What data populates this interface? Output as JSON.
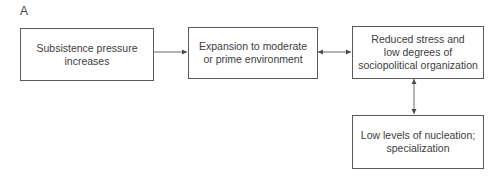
{
  "panel_label": "A",
  "nodes": [
    {
      "id": "n1",
      "text": "Subsistence pressure\nincreases"
    },
    {
      "id": "n2",
      "text": "Expansion to moderate\nor prime environment"
    },
    {
      "id": "n3",
      "text": "Reduced stress and\nlow degrees of\nsociopolitical organization"
    },
    {
      "id": "n4",
      "text": "Low levels of nucleation;\nspecialization"
    }
  ],
  "edges": [
    {
      "from": "n1",
      "to": "n2",
      "direction": "forward"
    },
    {
      "from": "n2",
      "to": "n3",
      "direction": "bidirectional"
    },
    {
      "from": "n3",
      "to": "n4",
      "direction": "bidirectional"
    }
  ],
  "colors": {
    "stroke": "#5a5a5a",
    "text": "#3d3d3d",
    "background": "#ffffff"
  }
}
